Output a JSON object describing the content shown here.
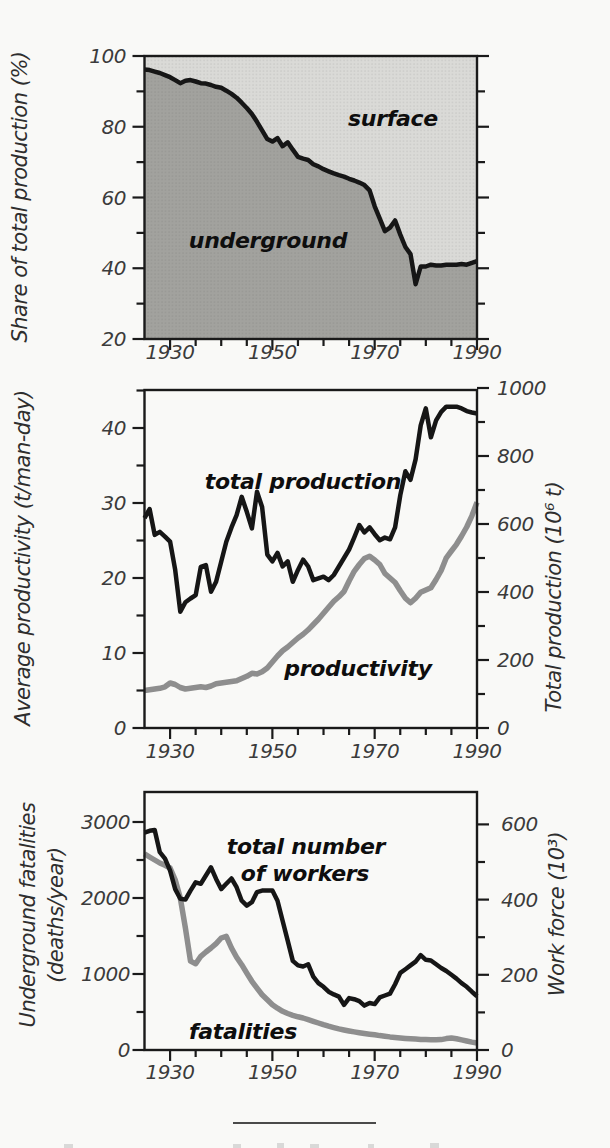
{
  "palette": {
    "black_line": "#161616",
    "gray_line": "#8e8e8e",
    "underground_fill": "#a2a29e",
    "surface_fill": "#dadad7",
    "axis": "#1a1a1a",
    "tick_text": "#3b3b3b",
    "paper": "#f9f9f7"
  },
  "separator_rule": {
    "present": true
  },
  "chart_data": [
    {
      "type": "area",
      "title": "",
      "ylabel": "Share of total production (%)",
      "xlabel": "",
      "xlim": [
        1925,
        1990
      ],
      "ylim": [
        20,
        100
      ],
      "grid": false,
      "legend_position": "labels inside plot",
      "xticks": [
        1930,
        1950,
        1970,
        1990
      ],
      "xticks_minor_step": 5,
      "yticks": [
        20,
        40,
        60,
        80,
        100
      ],
      "yticks_minor": [
        30,
        50,
        70,
        90
      ],
      "area_labels": {
        "upper": "surface",
        "lower": "underground"
      },
      "x": [
        1925,
        1926,
        1927,
        1928,
        1929,
        1930,
        1931,
        1932,
        1933,
        1934,
        1935,
        1936,
        1937,
        1938,
        1939,
        1940,
        1941,
        1942,
        1943,
        1944,
        1945,
        1946,
        1947,
        1948,
        1949,
        1950,
        1951,
        1952,
        1953,
        1954,
        1955,
        1956,
        1957,
        1958,
        1959,
        1960,
        1961,
        1962,
        1963,
        1964,
        1965,
        1966,
        1967,
        1968,
        1969,
        1970,
        1971,
        1972,
        1973,
        1974,
        1975,
        1976,
        1977,
        1978,
        1979,
        1980,
        1981,
        1982,
        1983,
        1984,
        1985,
        1986,
        1987,
        1988,
        1989,
        1990
      ],
      "series": [
        {
          "name": "underground share of total production (%)",
          "values": [
            96.2,
            96.0,
            95.6,
            95.2,
            94.6,
            94.0,
            93.2,
            92.3,
            93.0,
            93.2,
            92.8,
            92.3,
            92.2,
            91.8,
            91.3,
            91.0,
            90.2,
            89.3,
            88.2,
            86.8,
            85.3,
            83.6,
            81.4,
            79.0,
            76.5,
            75.8,
            76.8,
            74.5,
            75.6,
            73.5,
            71.5,
            71.0,
            70.6,
            69.4,
            68.8,
            68.0,
            67.4,
            66.8,
            66.3,
            65.9,
            65.3,
            64.8,
            64.2,
            63.5,
            62.0,
            57.5,
            54.0,
            50.5,
            51.5,
            53.5,
            49.5,
            46.0,
            44.0,
            35.5,
            40.5,
            40.5,
            41.0,
            40.8,
            40.8,
            41.0,
            41.0,
            41.0,
            41.2,
            41.0,
            41.5,
            42.0
          ]
        }
      ]
    },
    {
      "type": "line",
      "title": "",
      "ylabel_left": "Average productivity (t/man-day)",
      "ylabel_right": "Total production (10⁶ t)",
      "xlim": [
        1925,
        1990
      ],
      "ylim_left": [
        0,
        45
      ],
      "ylim_right": [
        0,
        1000
      ],
      "grid": false,
      "legend_position": "labels inside plot",
      "xticks": [
        1930,
        1950,
        1970,
        1990
      ],
      "xticks_minor_step": 5,
      "yticks_left": [
        0,
        10,
        20,
        30,
        40
      ],
      "yticks_left_minor": [
        5,
        15,
        25,
        35,
        45
      ],
      "yticks_right": [
        0,
        200,
        400,
        600,
        800,
        1000
      ],
      "yticks_right_minor": [
        100,
        300,
        500,
        700,
        900
      ],
      "labels_in_plot": {
        "black": "total production",
        "gray": "productivity"
      },
      "x": [
        1925,
        1926,
        1927,
        1928,
        1929,
        1930,
        1931,
        1932,
        1933,
        1934,
        1935,
        1936,
        1937,
        1938,
        1939,
        1940,
        1941,
        1942,
        1943,
        1944,
        1945,
        1946,
        1947,
        1948,
        1949,
        1950,
        1951,
        1952,
        1953,
        1954,
        1955,
        1956,
        1957,
        1958,
        1959,
        1960,
        1961,
        1962,
        1963,
        1964,
        1965,
        1966,
        1967,
        1968,
        1969,
        1970,
        1971,
        1972,
        1973,
        1974,
        1975,
        1976,
        1977,
        1978,
        1979,
        1980,
        1981,
        1982,
        1983,
        1984,
        1985,
        1986,
        1987,
        1988,
        1989,
        1990
      ],
      "series": [
        {
          "name": "total production (10⁶ t)",
          "axis": "right",
          "color": "black",
          "values": [
            617,
            644,
            568,
            577,
            563,
            548,
            465,
            342,
            370,
            381,
            391,
            474,
            479,
            401,
            430,
            489,
            548,
            590,
            626,
            680,
            636,
            587,
            695,
            650,
            510,
            490,
            515,
            475,
            490,
            430,
            465,
            495,
            475,
            435,
            440,
            445,
            435,
            450,
            475,
            500,
            525,
            560,
            597,
            575,
            590,
            570,
            552,
            560,
            555,
            590,
            685,
            755,
            730,
            790,
            890,
            940,
            855,
            905,
            930,
            945,
            945,
            945,
            940,
            932,
            928,
            925
          ]
        },
        {
          "name": "average productivity (t/man-day)",
          "axis": "left",
          "color": "gray",
          "values": [
            5.0,
            5.1,
            5.2,
            5.3,
            5.5,
            6.0,
            5.8,
            5.4,
            5.2,
            5.3,
            5.4,
            5.5,
            5.4,
            5.6,
            5.9,
            6.0,
            6.1,
            6.2,
            6.3,
            6.6,
            6.9,
            7.3,
            7.2,
            7.5,
            8.0,
            8.8,
            9.6,
            10.3,
            10.8,
            11.4,
            12.0,
            12.5,
            13.1,
            13.8,
            14.5,
            15.3,
            16.1,
            16.9,
            17.5,
            18.2,
            19.6,
            20.9,
            21.8,
            22.6,
            22.9,
            22.4,
            21.8,
            20.6,
            20.0,
            19.4,
            18.3,
            17.3,
            16.7,
            17.3,
            18.1,
            18.4,
            18.7,
            19.8,
            21.0,
            22.7,
            23.6,
            24.5,
            25.6,
            26.8,
            28.3,
            30.1
          ]
        }
      ]
    },
    {
      "type": "line",
      "title": "",
      "ylabel_left_line1": "Underground fatalities",
      "ylabel_left_line2": "(deaths/year)",
      "ylabel_right": "Work force (10³)",
      "xlim": [
        1925,
        1990
      ],
      "ylim_left": [
        0,
        3400
      ],
      "ylim_right": [
        0,
        680
      ],
      "grid": false,
      "legend_position": "labels inside plot",
      "xticks": [
        1930,
        1950,
        1970,
        1990
      ],
      "xticks_minor_step": 5,
      "yticks_left": [
        0,
        1000,
        2000,
        3000
      ],
      "yticks_left_minor": [
        500,
        1500,
        2500
      ],
      "yticks_right": [
        0,
        200,
        400,
        600
      ],
      "yticks_right_minor": [
        100,
        300,
        500
      ],
      "labels_in_plot": {
        "black_line1": "total number",
        "black_line2": "of workers",
        "gray": "fatalities"
      },
      "x": [
        1925,
        1926,
        1927,
        1928,
        1929,
        1930,
        1931,
        1932,
        1933,
        1934,
        1935,
        1936,
        1937,
        1938,
        1939,
        1940,
        1941,
        1942,
        1943,
        1944,
        1945,
        1946,
        1947,
        1948,
        1949,
        1950,
        1951,
        1952,
        1953,
        1954,
        1955,
        1956,
        1957,
        1958,
        1959,
        1960,
        1961,
        1962,
        1963,
        1964,
        1965,
        1966,
        1967,
        1968,
        1969,
        1970,
        1971,
        1972,
        1973,
        1974,
        1975,
        1976,
        1977,
        1978,
        1979,
        1980,
        1981,
        1982,
        1983,
        1984,
        1985,
        1986,
        1987,
        1988,
        1989,
        1990
      ],
      "series": [
        {
          "name": "total number of workers (10³)",
          "axis": "right",
          "color": "black",
          "values": [
            578,
            583,
            585,
            526,
            509,
            477,
            428,
            402,
            400,
            424,
            446,
            442,
            464,
            486,
            455,
            428,
            442,
            456,
            433,
            397,
            384,
            393,
            420,
            424,
            424,
            424,
            397,
            344,
            291,
            237,
            225,
            222,
            228,
            195,
            178,
            168,
            155,
            148,
            142,
            120,
            138,
            135,
            130,
            118,
            125,
            122,
            140,
            145,
            150,
            175,
            205,
            215,
            225,
            235,
            252,
            240,
            238,
            228,
            218,
            210,
            200,
            190,
            178,
            168,
            155,
            143
          ]
        },
        {
          "name": "underground fatalities (deaths/year)",
          "axis": "left",
          "color": "gray",
          "values": [
            2580,
            2540,
            2500,
            2460,
            2430,
            2395,
            2240,
            2000,
            1605,
            1170,
            1136,
            1233,
            1290,
            1342,
            1400,
            1474,
            1496,
            1342,
            1220,
            1122,
            1010,
            904,
            815,
            728,
            660,
            596,
            550,
            509,
            480,
            457,
            437,
            421,
            400,
            378,
            355,
            333,
            313,
            295,
            278,
            263,
            250,
            238,
            227,
            217,
            208,
            200,
            190,
            181,
            173,
            166,
            159,
            153,
            148,
            144,
            140,
            137,
            135,
            134,
            137,
            150,
            158,
            148,
            133,
            118,
            104,
            92
          ]
        }
      ]
    }
  ]
}
